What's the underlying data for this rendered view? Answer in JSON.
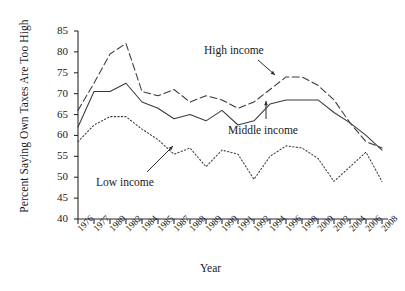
{
  "chart_data": {
    "type": "line",
    "title": "",
    "xlabel": "Year",
    "ylabel": "Percent Saying Own Taxes Are Too High",
    "ylim": [
      40,
      85
    ],
    "yticks": [
      40,
      45,
      50,
      55,
      60,
      65,
      70,
      75,
      80,
      85
    ],
    "grid": false,
    "legend_position": "inline-annotations",
    "categories": [
      "1976",
      "1977",
      "1980",
      "1982",
      "1984",
      "1985",
      "1987",
      "1988",
      "1989",
      "1990",
      "1991",
      "1992",
      "1994",
      "1996",
      "1998",
      "2000",
      "2002",
      "2004",
      "2006",
      "2008"
    ],
    "annotations": [
      {
        "label": "High income",
        "x": 1985,
        "y": 79
      },
      {
        "label": "Middle income",
        "x": 1992,
        "y": 69
      },
      {
        "label": "Low income",
        "x": 1985,
        "y": 56
      }
    ],
    "series": [
      {
        "name": "High income",
        "style": "dashed",
        "values": [
          66.0,
          72.5,
          79.5,
          82.0,
          70.5,
          69.5,
          71.0,
          68.0,
          69.5,
          68.5,
          66.5,
          68.0,
          71.0,
          74.0,
          74.0,
          72.0,
          68.5,
          63.0,
          58.5,
          57.0
        ]
      },
      {
        "name": "Middle income",
        "style": "solid",
        "values": [
          62.0,
          70.5,
          70.5,
          72.5,
          68.0,
          66.5,
          64.0,
          65.0,
          63.5,
          66.0,
          62.5,
          63.5,
          67.5,
          68.5,
          68.5,
          68.5,
          65.5,
          63.0,
          60.0,
          56.5
        ]
      },
      {
        "name": "Low income",
        "style": "dotted",
        "values": [
          58.5,
          62.5,
          64.5,
          64.5,
          61.5,
          59.0,
          55.5,
          57.0,
          52.5,
          56.5,
          55.5,
          49.5,
          55.0,
          57.5,
          57.0,
          54.5,
          49.0,
          52.5,
          56.0,
          49.0
        ]
      }
    ]
  },
  "colors": {
    "axis": "#2b2b2b",
    "line": "#3a3a3a",
    "text": "#1a1a1a"
  }
}
